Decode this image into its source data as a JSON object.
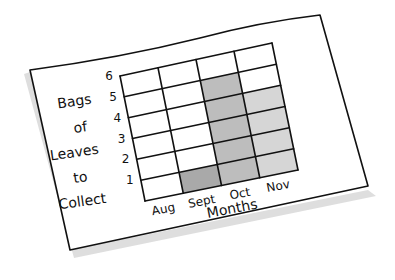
{
  "chart_data": {
    "type": "bar",
    "title": "",
    "xlabel": "Months",
    "ylabel": "Bags of Leaves to Collect",
    "ylabel_lines": [
      "Bags",
      "of",
      "Leaves",
      "to",
      "Collect"
    ],
    "categories": [
      "Aug",
      "Sept",
      "Oct",
      "Nov"
    ],
    "values": [
      0,
      1,
      5,
      4
    ],
    "yticks": [
      1,
      2,
      3,
      4,
      5,
      6
    ],
    "ylim": [
      0,
      6
    ],
    "grid": true,
    "legend": null,
    "style": "hand-drawn grid bar chart on tilted paper card",
    "bar_colors": [
      "#b0b0b0",
      "#a9a9a9",
      "#bdbdbd",
      "#d6d6d6"
    ]
  },
  "colors": {
    "paper": "#ffffff",
    "ink": "#111111",
    "shadow": "#d0d0d0"
  }
}
